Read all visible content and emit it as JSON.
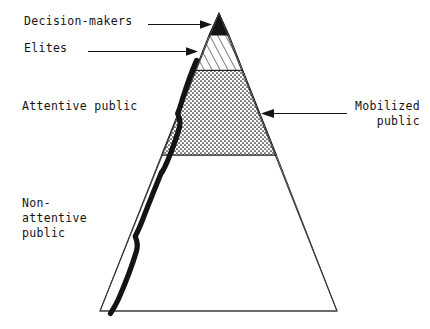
{
  "figure": {
    "background_color": "#ffffff",
    "ink_color": "#141414"
  },
  "labels": {
    "decision_makers": "Decision-makers",
    "elites": "Elites",
    "attentive_public": "Attentive public",
    "non_attentive_public": "Non-\nattentive\npublic",
    "mobilized_public": "Mobilized\npublic"
  },
  "pyramid": {
    "apex": {
      "x": 219,
      "y": 13
    },
    "base_left": {
      "x": 100,
      "y": 311
    },
    "base_right": {
      "x": 337,
      "y": 311
    },
    "bands": [
      {
        "name": "decision-makers",
        "fill": "solid-black",
        "top_y": 13,
        "bottom_y": 38,
        "label_ref": "decision_makers"
      },
      {
        "name": "elites",
        "fill": "diagonal-hatch",
        "top_y": 38,
        "bottom_y": 72,
        "label_ref": "elites"
      },
      {
        "name": "attentive-public",
        "fill": "dotted-stipple",
        "top_y": 72,
        "bottom_y": 155,
        "label_ref": "attentive_public"
      },
      {
        "name": "non-attentive-public",
        "fill": "white",
        "top_y": 155,
        "bottom_y": 311,
        "label_ref": "non_attentive_public"
      }
    ]
  },
  "arrows": [
    {
      "name": "arrow-decision-makers",
      "from_x": 148,
      "to_x": 210,
      "y": 24,
      "direction": "right"
    },
    {
      "name": "arrow-elites",
      "from_x": 88,
      "to_x": 196,
      "y": 51,
      "direction": "right"
    },
    {
      "name": "arrow-mobilized-public",
      "from_x": 347,
      "to_x": 262,
      "y": 113,
      "direction": "left"
    }
  ],
  "braces": [
    {
      "name": "brace-attentive-public",
      "top_y": 62,
      "bottom_y": 170
    },
    {
      "name": "brace-non-attentive-public",
      "top_y": 170,
      "bottom_y": 312
    }
  ]
}
